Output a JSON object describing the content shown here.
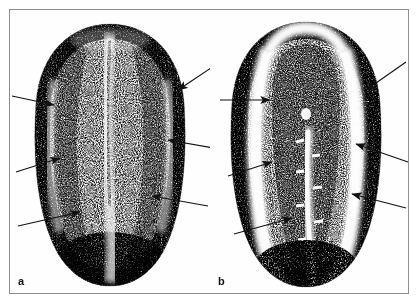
{
  "figure": {
    "background_color": "#ffffff",
    "border_color": "#8e8e8e",
    "ink_color": "#1a1a1a",
    "width": 420,
    "height": 305
  },
  "panels": [
    {
      "id": "a",
      "label": "a",
      "description": "Dorsal whole-mount view of an elongated embryo showing a darkly stippled outer rim, paired longitudinal ridges flanking a pale midline groove, and a rounded posterior pole.",
      "arrow_color": "#111111",
      "arrows": [
        {
          "name": "arrow-a-left-upper",
          "x1": 12,
          "y1": 96,
          "x2": 52,
          "y2": 104,
          "direction": "right"
        },
        {
          "name": "arrow-a-left-middle",
          "x1": 16,
          "y1": 172,
          "x2": 58,
          "y2": 158,
          "direction": "upper-right"
        },
        {
          "name": "arrow-a-left-lower",
          "x1": 18,
          "y1": 226,
          "x2": 78,
          "y2": 212,
          "direction": "upper-right"
        },
        {
          "name": "arrow-a-right-upper",
          "x1": 214,
          "y1": 66,
          "x2": 176,
          "y2": 90,
          "direction": "lower-left"
        },
        {
          "name": "arrow-a-right-middle",
          "x1": 214,
          "y1": 148,
          "x2": 166,
          "y2": 140,
          "direction": "left"
        },
        {
          "name": "arrow-a-right-lower",
          "x1": 208,
          "y1": 206,
          "x2": 150,
          "y2": 196,
          "direction": "left"
        }
      ]
    },
    {
      "id": "b",
      "label": "b",
      "description": "Horseshoe-shaped transverse view of the same embryo showing a pale U-shaped internal channel bordered by dense stippled neural tissue, with small white transverse tick marks along the ventral midline canal.",
      "arrow_color": "#111111",
      "arrow_count": 6,
      "arrows": [
        {
          "name": "arrow-b-left-upper",
          "x1": 222,
          "y1": 100,
          "x2": 270,
          "y2": 100,
          "direction": "right"
        },
        {
          "name": "arrow-b-left-middle",
          "x1": 230,
          "y1": 176,
          "x2": 272,
          "y2": 162,
          "direction": "upper-right"
        },
        {
          "name": "arrow-b-left-lower",
          "x1": 236,
          "y1": 234,
          "x2": 292,
          "y2": 218,
          "direction": "upper-right"
        },
        {
          "name": "arrow-b-right-upper",
          "x1": 404,
          "y1": 62,
          "x2": 366,
          "y2": 90,
          "direction": "lower-left"
        },
        {
          "name": "arrow-b-right-middle",
          "x1": 408,
          "y1": 162,
          "x2": 356,
          "y2": 144,
          "direction": "left"
        },
        {
          "name": "arrow-b-right-lower",
          "x1": 404,
          "y1": 208,
          "x2": 352,
          "y2": 194,
          "direction": "left"
        }
      ],
      "midline_ticks": 7
    }
  ]
}
